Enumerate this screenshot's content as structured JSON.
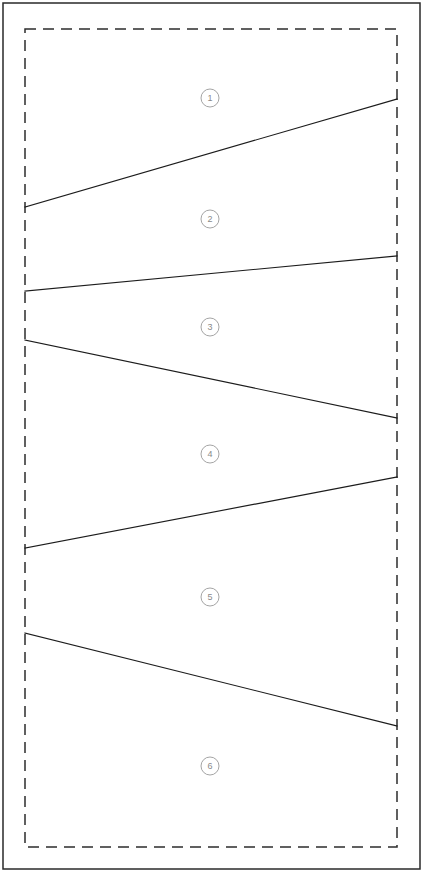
{
  "diagram": {
    "canvas": {
      "width": 423,
      "height": 880,
      "background": "#ffffff"
    },
    "outer_frame": {
      "name": "outer-frame",
      "x": 3,
      "y": 3,
      "width": 417,
      "height": 866,
      "stroke": "#2a2a2a",
      "stroke_width": 1.5,
      "style": "solid"
    },
    "dashed_boundary": {
      "name": "dashed-boundary",
      "x": 25,
      "y": 29,
      "width": 372,
      "height": 818,
      "stroke": "#2d2d2d",
      "stroke_width": 1.5,
      "style": "dashed",
      "dash_pattern": "11 7"
    },
    "division_lines": [
      {
        "id": "line-1",
        "x1": 25,
        "y1": 207,
        "x2": 397,
        "y2": 99,
        "separates": "1 / 2",
        "slope": "up-right"
      },
      {
        "id": "line-2",
        "x1": 25,
        "y1": 291,
        "x2": 397,
        "y2": 256,
        "separates": "2 / 3",
        "slope": "up-right"
      },
      {
        "id": "line-3",
        "x1": 25,
        "y1": 340,
        "x2": 397,
        "y2": 418,
        "separates": "3 / 4",
        "slope": "down-right"
      },
      {
        "id": "line-4",
        "x1": 25,
        "y1": 548,
        "x2": 397,
        "y2": 477,
        "separates": "4 / 5",
        "slope": "up-right"
      },
      {
        "id": "line-5",
        "x1": 25,
        "y1": 633,
        "x2": 397,
        "y2": 726,
        "separates": "5 / 6",
        "slope": "down-right"
      }
    ],
    "line_color": "#1c1c1c",
    "callout_color": "#9a9a9a",
    "callouts": [
      {
        "label": "1",
        "cx": 210,
        "cy": 98,
        "r": 9
      },
      {
        "label": "2",
        "cx": 210,
        "cy": 219,
        "r": 9
      },
      {
        "label": "3",
        "cx": 210,
        "cy": 327,
        "r": 9
      },
      {
        "label": "4",
        "cx": 210,
        "cy": 454,
        "r": 9
      },
      {
        "label": "5",
        "cx": 210,
        "cy": 597,
        "r": 9
      },
      {
        "label": "6",
        "cx": 210,
        "cy": 766,
        "r": 9
      }
    ]
  }
}
